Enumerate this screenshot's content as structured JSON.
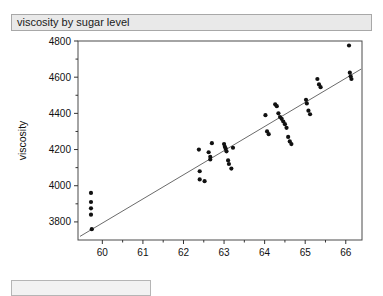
{
  "window": {
    "title": "viscosity by sugar level"
  },
  "chart_data": {
    "type": "scatter",
    "title": "viscosity by sugar level",
    "xlabel": "sugar level",
    "ylabel": "viscosity",
    "xlim": [
      59.4,
      66.4
    ],
    "ylim": [
      3700,
      4800
    ],
    "xticks": [
      60,
      61,
      62,
      63,
      64,
      65,
      66
    ],
    "yticks": [
      3800,
      4000,
      4200,
      4400,
      4600,
      4800
    ],
    "grid": false,
    "legend": false,
    "point_color": "#111111",
    "line_color": "#6b6b6b",
    "series": [
      {
        "name": "observations",
        "x": [
          59.72,
          59.72,
          59.72,
          59.72,
          59.74,
          62.38,
          62.4,
          62.4,
          62.52,
          62.62,
          62.66,
          62.66,
          62.7,
          63.0,
          63.02,
          63.04,
          63.06,
          63.1,
          63.12,
          63.18,
          63.22,
          64.02,
          64.06,
          64.1,
          64.26,
          64.3,
          64.34,
          64.38,
          64.42,
          64.46,
          64.5,
          64.54,
          64.58,
          64.62,
          64.66,
          65.02,
          65.04,
          65.08,
          65.12,
          65.3,
          65.34,
          65.38,
          66.08,
          66.1,
          66.12,
          66.14
        ],
        "y": [
          3960,
          3910,
          3875,
          3840,
          3760,
          4200,
          4080,
          4035,
          4025,
          4185,
          4160,
          4145,
          4235,
          4230,
          4215,
          4205,
          4190,
          4140,
          4120,
          4095,
          4210,
          4390,
          4300,
          4285,
          4450,
          4440,
          4400,
          4380,
          4370,
          4355,
          4340,
          4320,
          4270,
          4245,
          4230,
          4475,
          4455,
          4415,
          4395,
          4590,
          4560,
          4545,
          4775,
          4625,
          4605,
          4590
        ]
      }
    ],
    "fit_line": {
      "name": "linear fit",
      "x": [
        59.45,
        66.38
      ],
      "y": [
        3720,
        4645
      ]
    }
  }
}
